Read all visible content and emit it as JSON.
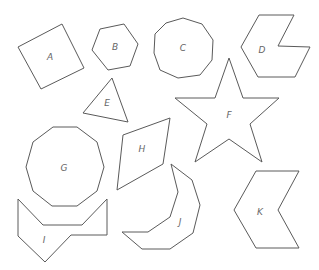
{
  "shapes": [
    {
      "id": "A",
      "label": "A",
      "kind": "square",
      "points": "18,47 62,24 84,68 41,89",
      "label_pos": [
        50,
        57
      ]
    },
    {
      "id": "B",
      "label": "B",
      "kind": "hexagon",
      "points": "100,29 124,24 138,44 130,66 108,70 92,50",
      "label_pos": [
        115,
        47
      ]
    },
    {
      "id": "C",
      "label": "C",
      "kind": "nonagon",
      "points": "183,18 202,24 213,40 212,60 200,75 178,78 160,70 154,53 155,34 166,23",
      "label_pos": [
        183,
        48
      ]
    },
    {
      "id": "D",
      "label": "D",
      "kind": "concave heptagon",
      "points": "259,15 294,15 278,46 310,47 295,77 258,77 241,47",
      "label_pos": [
        262,
        50
      ]
    },
    {
      "id": "E",
      "label": "E",
      "kind": "triangle",
      "points": "112,78 128,122 83,113",
      "label_pos": [
        107,
        103
      ]
    },
    {
      "id": "F",
      "label": "F",
      "kind": "star",
      "points": "229,58 243,98 279,98 250,124 262,162 229,139 195,162 207,124 175,98 215,98",
      "label_pos": [
        229,
        115
      ]
    },
    {
      "id": "G",
      "label": "G",
      "kind": "decagon",
      "points": "53,127 77,127 97,142 104,167 97,191 77,206 52,206 33,191 26,167 33,142",
      "label_pos": [
        64,
        168
      ]
    },
    {
      "id": "H",
      "label": "H",
      "kind": "parallelogram",
      "points": "123,135 170,118 163,164 117,190",
      "label_pos": [
        142,
        149
      ]
    },
    {
      "id": "I",
      "label": "I",
      "kind": "concave octagon",
      "points": "18,199 43,225 82,225 107,199 107,235 71,235 45,262 18,236",
      "label_pos": [
        44,
        240
      ]
    },
    {
      "id": "J",
      "label": "J",
      "kind": "crescent polygon",
      "points": "171,164 192,180 200,205 193,233 170,249 142,249 122,232 148,232 170,217 178,192",
      "label_pos": [
        180,
        222
      ]
    },
    {
      "id": "K",
      "label": "K",
      "kind": "chevron hexagon",
      "points": "256,171 299,171 278,210 299,248 256,248 234,210",
      "label_pos": [
        260,
        212
      ]
    }
  ],
  "colors": {
    "stroke": "#5a5a5a",
    "label": "#666666",
    "background": "#ffffff"
  }
}
